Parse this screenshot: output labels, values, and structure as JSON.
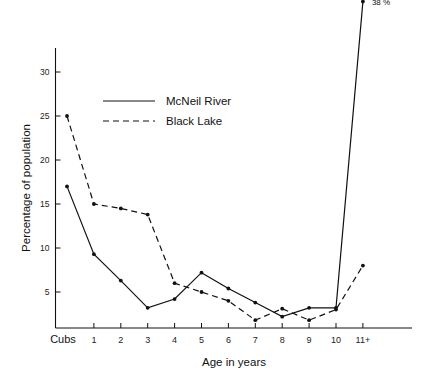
{
  "chart_data": {
    "type": "line",
    "title": "",
    "xlabel": "Age in years",
    "ylabel": "Percentage of population",
    "categories": [
      "Cubs",
      "1",
      "2",
      "3",
      "4",
      "5",
      "6",
      "7",
      "8",
      "9",
      "10",
      "11+"
    ],
    "yticks": [
      5,
      10,
      15,
      20,
      25,
      30
    ],
    "ylim": [
      0,
      33
    ],
    "grid": false,
    "legend_position": "upper-center-left",
    "series": [
      {
        "name": "McNeil River",
        "style": "solid",
        "values": [
          17,
          9.3,
          6.3,
          3.2,
          4.2,
          7.2,
          5.4,
          3.8,
          2.2,
          3.2,
          3.2,
          38
        ]
      },
      {
        "name": "Black Lake",
        "style": "dashed",
        "values": [
          25,
          15,
          14.5,
          13.8,
          6,
          5,
          4,
          1.8,
          3.1,
          1.8,
          3,
          8
        ]
      }
    ],
    "annotations": [
      {
        "text": "38 %",
        "category": "11+",
        "value": 38,
        "series": "McNeil River"
      }
    ]
  },
  "legend": {
    "entries": [
      {
        "label": "McNeil River",
        "style": "solid"
      },
      {
        "label": "Black Lake",
        "style": "dashed"
      }
    ]
  },
  "axes": {
    "y_title": "Percentage of population",
    "x_title": "Age in years",
    "y_tick_labels": [
      "30",
      "25",
      "20",
      "15",
      "10",
      "5"
    ],
    "x_tick_labels": [
      "Cubs",
      "1",
      "2",
      "3",
      "4",
      "5",
      "6",
      "7",
      "8",
      "9",
      "10",
      "11+"
    ]
  },
  "colors": {
    "ink": "#111111",
    "background": "#ffffff"
  }
}
